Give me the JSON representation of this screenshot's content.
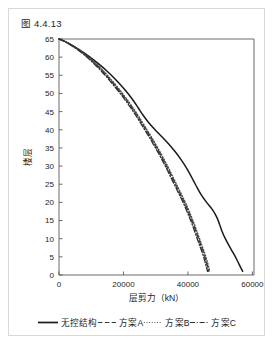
{
  "figure": {
    "caption": "图 4.4.13"
  },
  "chart_data": {
    "type": "line",
    "title": "",
    "xlabel": "层剪力（kN）",
    "ylabel": "楼层",
    "xlim": [
      0,
      60500
    ],
    "ylim": [
      0,
      65
    ],
    "xticks": [
      0,
      20000,
      40000,
      60000
    ],
    "xtick_labels": [
      "0",
      "20000",
      "40000",
      "60000"
    ],
    "yticks": [
      0,
      5,
      10,
      15,
      20,
      25,
      30,
      35,
      40,
      45,
      50,
      55,
      60,
      65
    ],
    "ytick_labels": [
      "0",
      "5",
      "10",
      "15",
      "20",
      "25",
      "30",
      "35",
      "40",
      "45",
      "50",
      "55",
      "60",
      "65"
    ],
    "grid": false,
    "legend_position": "bottom",
    "orientation": "y-is-story",
    "series": [
      {
        "name": "无控结构",
        "style": "solid",
        "color": "#1a1a1a",
        "y": [
          65,
          64,
          62,
          60,
          58,
          56,
          54,
          52,
          50,
          48,
          46,
          44,
          42,
          40,
          38,
          36,
          34,
          32,
          30,
          28,
          26,
          24,
          22,
          20,
          18,
          16,
          14,
          12,
          10,
          8,
          6,
          4,
          2,
          1
        ],
        "x": [
          0,
          2600,
          6400,
          9600,
          12500,
          15100,
          17400,
          19500,
          21400,
          23100,
          24600,
          26100,
          27800,
          29800,
          32000,
          34100,
          36000,
          37700,
          39200,
          40500,
          41700,
          42900,
          44200,
          45800,
          47600,
          48900,
          49800,
          50600,
          51600,
          52800,
          54100,
          55300,
          56400,
          57000
        ]
      },
      {
        "name": "方案A",
        "style": "dashed",
        "color": "#3a3a3a",
        "y": [
          65,
          64,
          62,
          60,
          58,
          56,
          54,
          52,
          50,
          48,
          46,
          44,
          42,
          40,
          38,
          36,
          34,
          32,
          30,
          28,
          26,
          24,
          22,
          20,
          18,
          16,
          14,
          12,
          10,
          8,
          6,
          4,
          2,
          1
        ],
        "x": [
          0,
          2500,
          6100,
          9000,
          11500,
          13700,
          15700,
          17600,
          19400,
          21100,
          22700,
          24200,
          25600,
          27000,
          28400,
          29700,
          31000,
          32200,
          33400,
          34500,
          35600,
          36700,
          37800,
          38900,
          39900,
          40800,
          41700,
          42500,
          43300,
          44100,
          44900,
          45600,
          46200,
          46500
        ]
      },
      {
        "name": "方案B",
        "style": "dotted",
        "color": "#4a4a4a",
        "y": [
          65,
          64,
          62,
          60,
          58,
          56,
          54,
          52,
          50,
          48,
          46,
          44,
          42,
          40,
          38,
          36,
          34,
          32,
          30,
          28,
          26,
          24,
          22,
          20,
          18,
          16,
          14,
          12,
          10,
          8,
          6,
          4,
          2,
          1
        ],
        "x": [
          0,
          2500,
          6200,
          9200,
          11800,
          14000,
          16000,
          17900,
          19700,
          21400,
          23000,
          24500,
          25900,
          27300,
          28700,
          30000,
          31300,
          32500,
          33700,
          34800,
          35900,
          37000,
          38100,
          39200,
          40200,
          41100,
          42000,
          42800,
          43600,
          44400,
          45200,
          45900,
          46500,
          46800
        ]
      },
      {
        "name": "方案C",
        "style": "dashdot",
        "color": "#2e2e2e",
        "y": [
          65,
          64,
          62,
          60,
          58,
          56,
          54,
          52,
          50,
          48,
          46,
          44,
          42,
          40,
          38,
          36,
          34,
          32,
          30,
          28,
          26,
          24,
          22,
          20,
          18,
          16,
          14,
          12,
          10,
          8,
          6,
          4,
          2,
          1
        ],
        "x": [
          0,
          2450,
          5900,
          8700,
          11100,
          13300,
          15300,
          17200,
          19000,
          20700,
          22300,
          23800,
          25200,
          26600,
          28000,
          29300,
          30600,
          31800,
          33000,
          34100,
          35200,
          36300,
          37400,
          38500,
          39500,
          40400,
          41300,
          42100,
          42900,
          43700,
          44500,
          45200,
          45800,
          46100
        ]
      }
    ]
  },
  "legend": {
    "items": [
      {
        "label": "无控结构",
        "style": "solid"
      },
      {
        "label": "方案A",
        "style": "dashed"
      },
      {
        "label": "方案B",
        "style": "dotted"
      },
      {
        "label": "方案C",
        "style": "dashdot"
      }
    ]
  }
}
